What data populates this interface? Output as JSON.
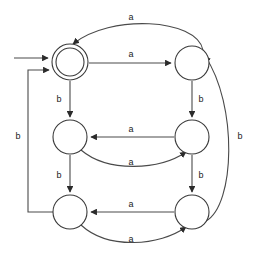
{
  "diagram": {
    "type": "finite-state-machine",
    "title": "",
    "alphabet": [
      "a",
      "b"
    ],
    "colors": {
      "background": "#ffffff",
      "stroke": "#4a4a4a",
      "node_stroke": "#3a3a3a",
      "label_text": "#1a1a1a",
      "arrowhead": "#2b2b2b"
    },
    "states": [
      {
        "id": "q0",
        "label": "",
        "cx": 70,
        "cy": 62,
        "r": 18,
        "accepting": true,
        "initial": true,
        "row": 0,
        "col": 0
      },
      {
        "id": "q1",
        "label": "",
        "cx": 192,
        "cy": 63,
        "r": 17,
        "accepting": false,
        "initial": false,
        "row": 0,
        "col": 1
      },
      {
        "id": "q2",
        "label": "",
        "cx": 70,
        "cy": 137,
        "r": 17,
        "accepting": false,
        "initial": false,
        "row": 1,
        "col": 0
      },
      {
        "id": "q3",
        "label": "",
        "cx": 192,
        "cy": 137,
        "r": 17,
        "accepting": false,
        "initial": false,
        "row": 1,
        "col": 1
      },
      {
        "id": "q4",
        "label": "",
        "cx": 70,
        "cy": 212,
        "r": 17,
        "accepting": false,
        "initial": false,
        "row": 2,
        "col": 0
      },
      {
        "id": "q5",
        "label": "",
        "cx": 192,
        "cy": 212,
        "r": 17,
        "accepting": false,
        "initial": false,
        "row": 2,
        "col": 1
      }
    ],
    "start_arrow": {
      "from_x": 14,
      "to_x": 50,
      "y": 58
    },
    "transitions": [
      {
        "id": "t1",
        "from": "q0",
        "to": "q1",
        "symbol": "a",
        "shape": "straight",
        "label_x": 131,
        "label_y": 55
      },
      {
        "id": "t2",
        "from": "q1",
        "to": "q0",
        "symbol": "a",
        "shape": "arc-top",
        "label_x": 131,
        "label_y": 18
      },
      {
        "id": "t3",
        "from": "q0",
        "to": "q2",
        "symbol": "b",
        "shape": "straight-vertical",
        "label_x": 59,
        "label_y": 100
      },
      {
        "id": "t4",
        "from": "q1",
        "to": "q3",
        "symbol": "b",
        "shape": "straight-vertical",
        "label_x": 201,
        "label_y": 100
      },
      {
        "id": "t5",
        "from": "q3",
        "to": "q2",
        "symbol": "a",
        "shape": "straight",
        "label_x": 131,
        "label_y": 130
      },
      {
        "id": "t6",
        "from": "q2",
        "to": "q3",
        "symbol": "a",
        "shape": "arc-below",
        "label_x": 131,
        "label_y": 163
      },
      {
        "id": "t7",
        "from": "q2",
        "to": "q4",
        "symbol": "b",
        "shape": "straight-vertical",
        "label_x": 59,
        "label_y": 176
      },
      {
        "id": "t8",
        "from": "q3",
        "to": "q5",
        "symbol": "b",
        "shape": "straight-vertical",
        "label_x": 201,
        "label_y": 176
      },
      {
        "id": "t9",
        "from": "q5",
        "to": "q4",
        "symbol": "a",
        "shape": "straight",
        "label_x": 131,
        "label_y": 205
      },
      {
        "id": "t10",
        "from": "q4",
        "to": "q5",
        "symbol": "a",
        "shape": "arc-below",
        "label_x": 131,
        "label_y": 240
      },
      {
        "id": "t11",
        "from": "q4",
        "to": "q0",
        "symbol": "b",
        "shape": "route-left",
        "label_x": 18,
        "label_y": 137
      },
      {
        "id": "t12",
        "from": "q5",
        "to": "q1",
        "symbol": "b",
        "shape": "arc-right",
        "label_x": 240,
        "label_y": 137
      }
    ],
    "labels": {
      "a": "a",
      "b": "b"
    }
  }
}
